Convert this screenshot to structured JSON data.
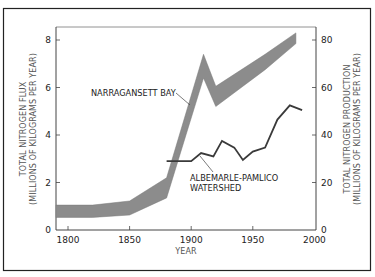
{
  "chart_data": {
    "type": "area",
    "title": "",
    "xlabel": "YEAR",
    "ylabel_left": [
      "TOTAL NITROGEN FLUX",
      "(MILLIONS OF KILOGRAMS PER YEAR)"
    ],
    "ylabel_right": [
      "TOTAL NITROGEN PRODUCTION",
      "(MILLIONS OF KILOGRAMS PER YEAR)"
    ],
    "xlim": [
      1790,
      2000
    ],
    "ylim_left": [
      0,
      8.6
    ],
    "ylim_right": [
      0,
      86
    ],
    "x_ticks": [
      1800,
      1850,
      1900,
      1950,
      2000
    ],
    "y_ticks_left": [
      0,
      2,
      4,
      6,
      8
    ],
    "y_ticks_right": [
      0,
      20,
      40,
      60,
      80
    ],
    "grid": false,
    "series": [
      {
        "name": "NARRAGANSETT BAY",
        "kind": "band",
        "axis": "left",
        "color": "#8c8c8c",
        "x": [
          1790,
          1820,
          1850,
          1880,
          1910,
          1920,
          1960,
          1985
        ],
        "lower": [
          0.53,
          0.53,
          0.63,
          1.35,
          6.4,
          5.2,
          6.75,
          7.85
        ],
        "upper": [
          1.05,
          1.05,
          1.22,
          2.2,
          7.4,
          6.05,
          7.4,
          8.3
        ]
      },
      {
        "name": "ALBEMARLE-PAMLICO WATERSHED",
        "kind": "line",
        "axis": "right",
        "color": "#3a3a3a",
        "x": [
          1880,
          1900,
          1908,
          1918,
          1925,
          1935,
          1942,
          1950,
          1960,
          1970,
          1980,
          1990
        ],
        "values": [
          29,
          29,
          32.4,
          31,
          37.5,
          34.7,
          29.5,
          33,
          34.7,
          46.5,
          52.5,
          50.5
        ]
      }
    ],
    "annotations": [
      {
        "text": "NARRAGANSETT BAY",
        "points_to": "NARRAGANSETT BAY band near 1905"
      },
      {
        "text": [
          "ALBEMARLE-PAMLICO",
          "WATERSHED"
        ],
        "points_to": "ALBEMARLE-PAMLICO line near 1908"
      }
    ],
    "legend": "none (direct labels)"
  }
}
